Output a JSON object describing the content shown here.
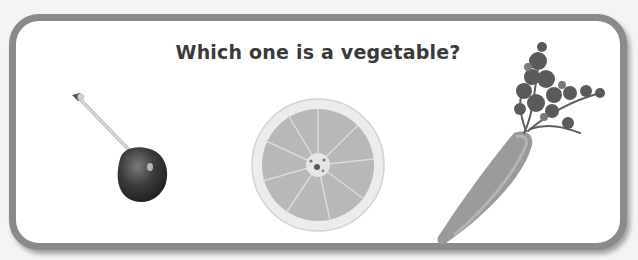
{
  "question": {
    "text": "Which one is a vegetable?"
  },
  "options": [
    {
      "id": "cherry",
      "label": "cherry",
      "icon": "cherry-icon"
    },
    {
      "id": "orange",
      "label": "orange slice",
      "icon": "orange-slice-icon"
    },
    {
      "id": "carrot",
      "label": "carrot",
      "icon": "carrot-icon"
    }
  ],
  "colors": {
    "border": "#8a8a8a",
    "text": "#3a3a3a",
    "background": "#ffffff"
  }
}
